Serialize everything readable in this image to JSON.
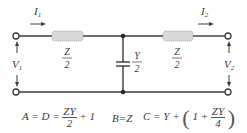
{
  "diagram": {
    "colors": {
      "wire": "#3a3a3a",
      "impedance_fill": "#d8d8d8",
      "impedance_border": "#9a9a9a"
    },
    "currents": {
      "input": "I1",
      "output": "I2",
      "input_sub": "1",
      "output_sub": "2",
      "input_main": "I",
      "output_main": "I"
    },
    "voltages": {
      "input_main": "V",
      "input_sub": "1",
      "output_main": "V",
      "output_sub": "2"
    },
    "series_left": {
      "num": "Z",
      "den": "2"
    },
    "series_right": {
      "num": "Z",
      "den": "2"
    },
    "shunt": {
      "num": "Y",
      "den": "2"
    }
  },
  "equations": {
    "a_d": {
      "lhs": "A = D =",
      "num": "ZY",
      "den": "2",
      "rhs": "+ 1"
    },
    "b": {
      "text": "B=Z"
    },
    "c": {
      "lhs": "C = Y +",
      "open": "(",
      "inner": "1 +",
      "num": "ZY",
      "den": "4",
      "close": ")"
    }
  }
}
